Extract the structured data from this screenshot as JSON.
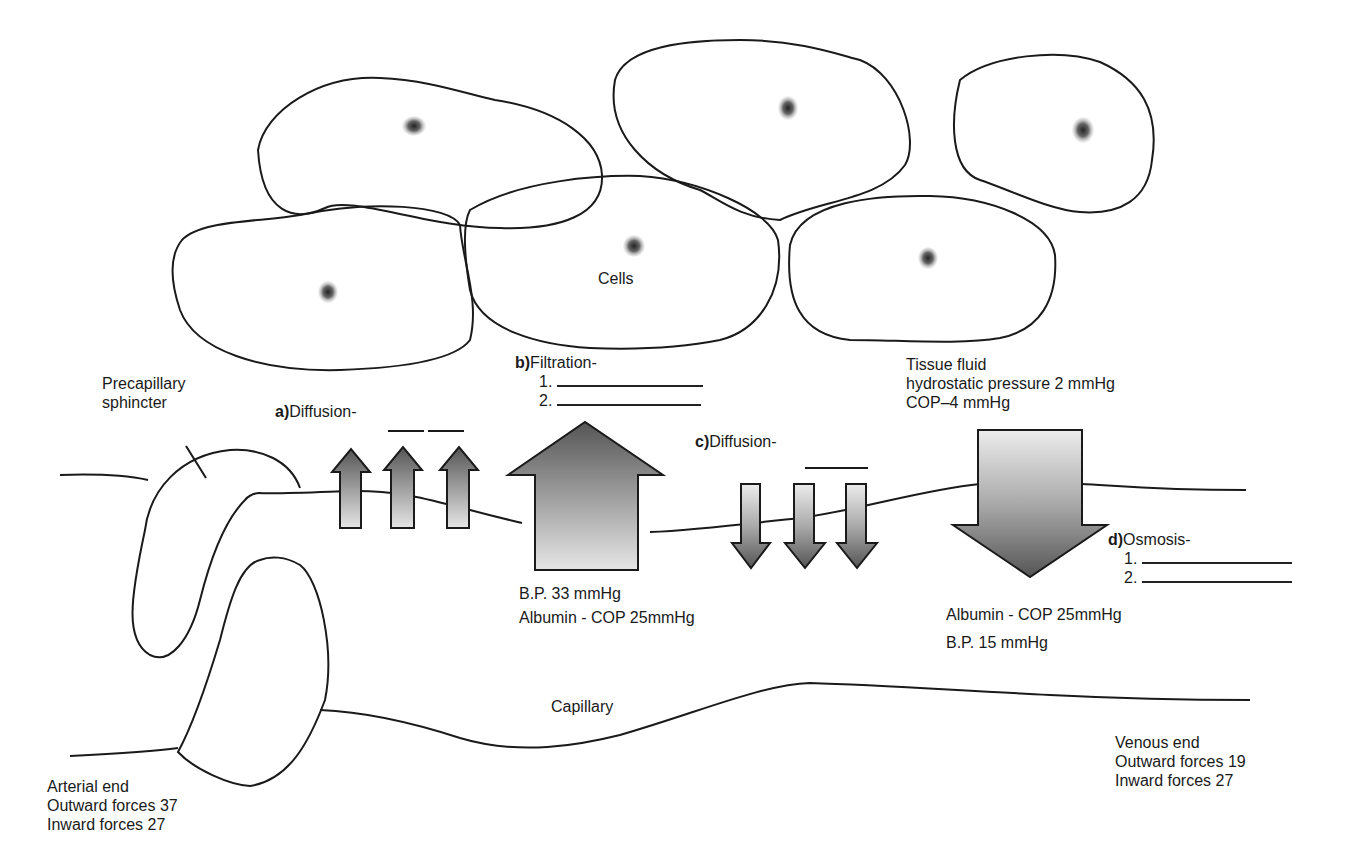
{
  "labels": {
    "cells": "Cells",
    "capillary": "Capillary",
    "precapillary_sphincter": [
      "Precapillary",
      "sphincter"
    ],
    "tissue_fluid": {
      "title": "Tissue fluid",
      "hydrostatic": "hydrostatic pressure 2 mmHg",
      "cop": "COP–4 mmHg"
    },
    "a": {
      "letter": "a)",
      "text": "Diffusion-"
    },
    "b": {
      "letter": "b)",
      "text": "Filtration-",
      "items": [
        "1.",
        "2."
      ]
    },
    "c": {
      "letter": "c)",
      "text": "Diffusion-"
    },
    "d": {
      "letter": "d)",
      "text": "Osmosis-",
      "items": [
        "1.",
        "2."
      ]
    },
    "arterial_values": {
      "bp": "B.P.  33 mmHg",
      "cop": "Albumin - COP  25mmHg"
    },
    "venous_values": {
      "cop": "Albumin - COP 25mmHg",
      "bp": "B.P.  15 mmHg"
    },
    "arterial_end": {
      "title": "Arterial end",
      "outward": "Outward forces 37",
      "inward": "Inward forces 27"
    },
    "venous_end": {
      "title": "Venous end",
      "outward": "Outward forces 19",
      "inward": "Inward forces 27"
    }
  },
  "colors": {
    "line": "#1a1a1a",
    "background": "#ffffff",
    "stipple_dark": "#4a4a4a"
  }
}
